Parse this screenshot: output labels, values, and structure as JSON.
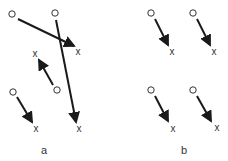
{
  "diagram": {
    "panels": [
      {
        "id": "a",
        "label": "a",
        "label_pos": [
          44,
          154
        ],
        "pairs": [
          {
            "origin_marker": "o",
            "target_marker": "x",
            "origin": [
              12,
              14
            ],
            "target": [
              78,
              51
            ],
            "arrow_from": [
              18,
              19
            ],
            "arrow_to": [
              74,
              46
            ]
          },
          {
            "origin_marker": "o",
            "target_marker": "x",
            "origin": [
              55,
              13
            ],
            "target": [
              79,
              128
            ],
            "arrow_from": [
              56,
              20
            ],
            "arrow_to": [
              76,
              122
            ]
          },
          {
            "origin_marker": "o",
            "target_marker": "x",
            "origin": [
              57,
              90
            ],
            "target": [
              35,
              53
            ],
            "arrow_from": [
              53,
              85
            ],
            "arrow_to": [
              39,
              60
            ]
          },
          {
            "origin_marker": "o",
            "target_marker": "x",
            "origin": [
              13,
              92
            ],
            "target": [
              36,
              128
            ],
            "arrow_from": [
              17,
              97
            ],
            "arrow_to": [
              32,
              122
            ]
          }
        ]
      },
      {
        "id": "b",
        "label": "b",
        "label_pos": [
          184,
          154
        ],
        "pairs": [
          {
            "origin_marker": "o",
            "target_marker": "x",
            "origin": [
              151,
              13
            ],
            "target": [
              172,
              51
            ],
            "arrow_from": [
              155,
              19
            ],
            "arrow_to": [
              168,
              45
            ]
          },
          {
            "origin_marker": "o",
            "target_marker": "x",
            "origin": [
              193,
              13
            ],
            "target": [
              214,
              51
            ],
            "arrow_from": [
              197,
              19
            ],
            "arrow_to": [
              210,
              45
            ]
          },
          {
            "origin_marker": "o",
            "target_marker": "x",
            "origin": [
              151,
              90
            ],
            "target": [
              173,
              128
            ],
            "arrow_from": [
              155,
              96
            ],
            "arrow_to": [
              168,
              121
            ]
          },
          {
            "origin_marker": "o",
            "target_marker": "x",
            "origin": [
              193,
              90
            ],
            "target": [
              217,
              127
            ],
            "arrow_from": [
              197,
              96
            ],
            "arrow_to": [
              211,
              121
            ]
          }
        ]
      }
    ],
    "colors": {
      "arrow": "#1a1a1a",
      "marker": "#333333",
      "background": "#ffffff"
    }
  }
}
